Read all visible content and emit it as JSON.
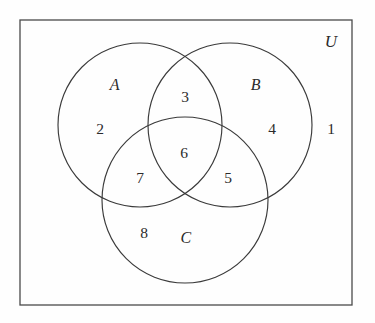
{
  "diagram": {
    "type": "venn-3-set",
    "kind": "three-circle Venn diagram with numbered regions",
    "universe_label": "U",
    "set_labels": [
      {
        "name": "A",
        "text": "A",
        "x": 115,
        "y": 85
      },
      {
        "name": "B",
        "text": "B",
        "x": 256,
        "y": 85
      },
      {
        "name": "C",
        "text": "C",
        "x": 186,
        "y": 238
      }
    ],
    "region_numbers": [
      {
        "name": "outside-all",
        "text": "1",
        "region": "complement of A,B,C",
        "x": 331,
        "y": 129
      },
      {
        "name": "only-a",
        "text": "2",
        "region": "A only",
        "x": 100,
        "y": 129
      },
      {
        "name": "a-and-b",
        "text": "3",
        "region": "A and B, not C",
        "x": 185,
        "y": 97
      },
      {
        "name": "only-b",
        "text": "4",
        "region": "B only",
        "x": 272,
        "y": 129
      },
      {
        "name": "b-and-c",
        "text": "5",
        "region": "B and C, not A",
        "x": 228,
        "y": 178
      },
      {
        "name": "a-b-and-c",
        "text": "6",
        "region": "A and B and C",
        "x": 184,
        "y": 153
      },
      {
        "name": "a-and-c",
        "text": "7",
        "region": "A and C, not B",
        "x": 140,
        "y": 178
      },
      {
        "name": "only-c",
        "text": "8",
        "region": "C only",
        "x": 144,
        "y": 233
      }
    ],
    "universe": {
      "x": 20,
      "y": 20,
      "width": 332,
      "height": 285,
      "label_x": 331,
      "label_y": 41
    },
    "circles": [
      {
        "name": "circle-a",
        "cx": 140,
        "cy": 125,
        "r": 82
      },
      {
        "name": "circle-b",
        "cx": 230,
        "cy": 125,
        "r": 82
      },
      {
        "name": "circle-c",
        "cx": 185,
        "cy": 200,
        "r": 83
      }
    ],
    "colors": {
      "background": "#fefefe",
      "rect_stroke": "#4a4a4a",
      "circle_stroke": "#3a3a3a",
      "text": "#2b2b2b"
    }
  }
}
